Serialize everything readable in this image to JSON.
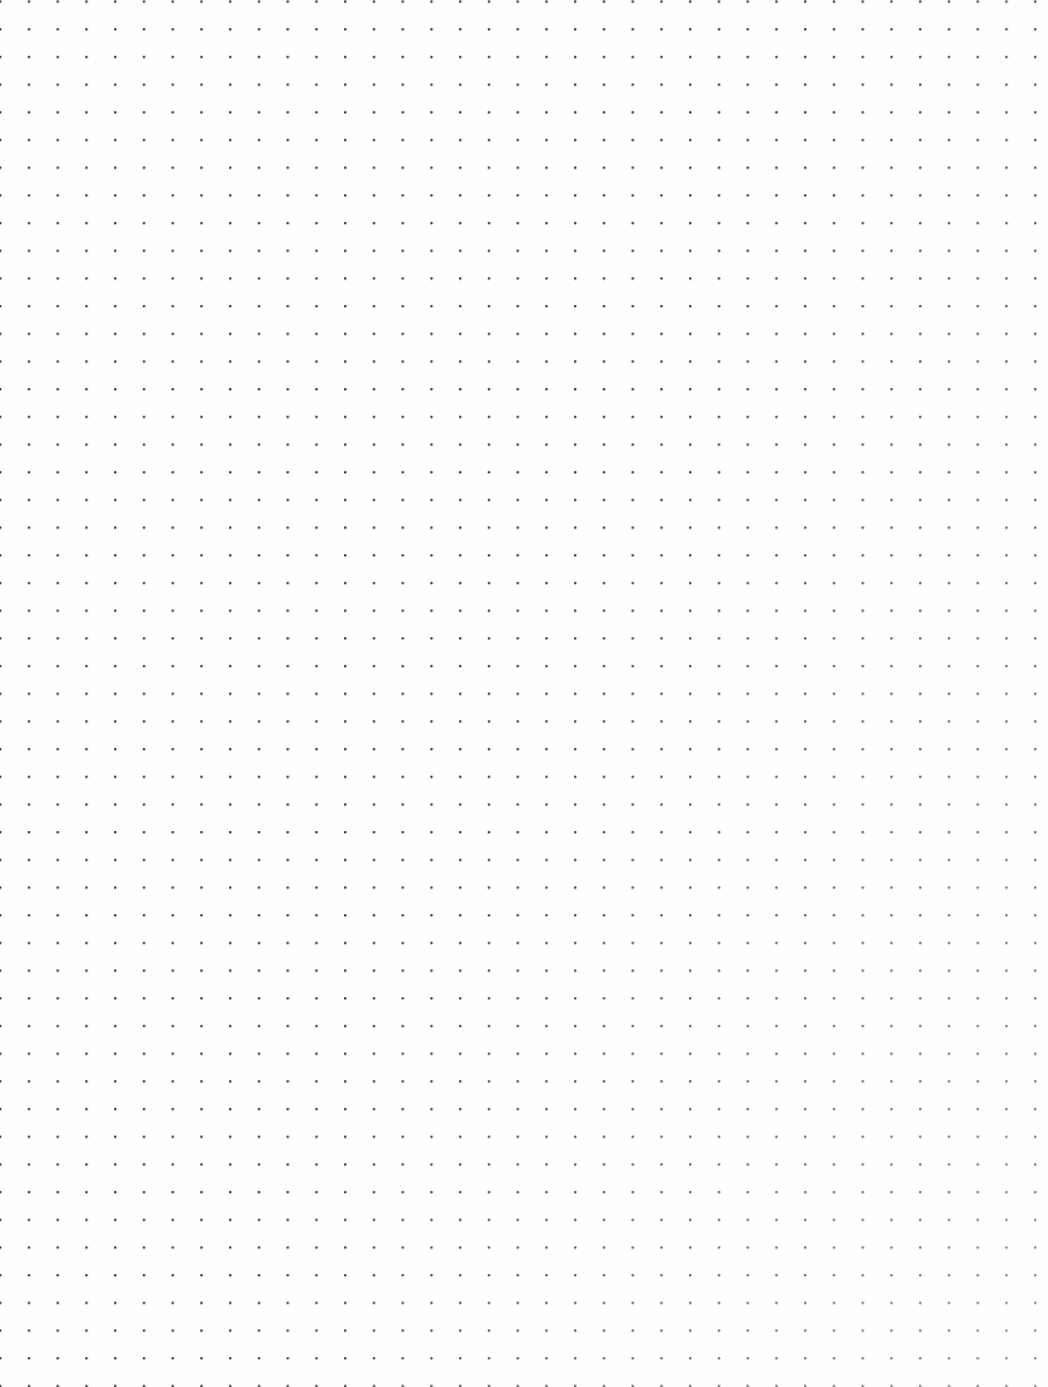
{
  "page": {
    "kind": "dot-grid-paper",
    "width_px": 1048,
    "height_px": 1387,
    "background_color": "#fefefe",
    "has_border": false,
    "has_text_content": false
  },
  "grid": {
    "dot_color": "#3a3a42",
    "dot_size_px": 2.5,
    "dot_shape": "round-square",
    "columns": 35,
    "rows": 47,
    "spacing_x_px": 28.75,
    "spacing_y_px": 27.7,
    "origin_x_px": 29,
    "origin_y_px": 57,
    "last_dot_x_px": 1008,
    "last_dot_y_px": 1345
  },
  "margins": {
    "left_px": 29,
    "right_px": 40,
    "top_px": 57,
    "bottom_px": 42
  }
}
